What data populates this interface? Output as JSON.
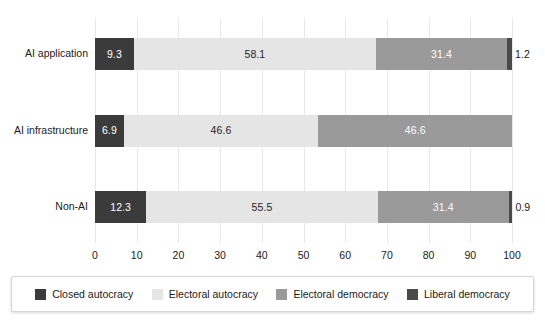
{
  "chart_data": {
    "type": "bar",
    "orientation": "horizontal",
    "stacked": true,
    "stack_mode": "percent",
    "title": "",
    "xlabel": "",
    "ylabel": "",
    "xlim": [
      0,
      100
    ],
    "xticks": [
      "0",
      "10",
      "20",
      "30",
      "40",
      "50",
      "60",
      "70",
      "80",
      "90",
      "100"
    ],
    "grid": "vertical",
    "legend_position": "bottom",
    "categories": [
      "AI application",
      "AI infrastructure",
      "Non-AI"
    ],
    "series": [
      {
        "name": "Closed autocracy",
        "color": "#3b3b3b",
        "label_color": "light",
        "values": [
          9.3,
          6.9,
          12.3
        ],
        "labels": [
          "9.3",
          "6.9",
          "12.3"
        ]
      },
      {
        "name": "Electoral autocracy",
        "color": "#e5e5e5",
        "label_color": "dark",
        "values": [
          58.1,
          46.6,
          55.5
        ],
        "labels": [
          "58.1",
          "46.6",
          "55.5"
        ]
      },
      {
        "name": "Electoral democracy",
        "color": "#9a9a9a",
        "label_color": "light",
        "values": [
          31.4,
          46.6,
          31.4
        ],
        "labels": [
          "31.4",
          "46.6",
          "31.4"
        ]
      },
      {
        "name": "Liberal democracy",
        "color": "#4a4a4a",
        "label_color": "light",
        "values": [
          1.2,
          0.0,
          0.9
        ],
        "labels": [
          "1.2",
          "",
          "0.9"
        ]
      }
    ]
  },
  "legend": {
    "items": [
      {
        "label": "Closed autocracy",
        "color": "#3b3b3b"
      },
      {
        "label": "Electoral autocracy",
        "color": "#e5e5e5"
      },
      {
        "label": "Electoral democracy",
        "color": "#9a9a9a"
      },
      {
        "label": "Liberal democracy",
        "color": "#4a4a4a"
      }
    ]
  }
}
